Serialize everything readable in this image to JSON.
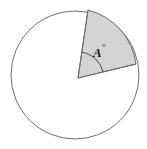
{
  "figure": {
    "name": "circle-with-shaded-sector",
    "caption": "",
    "background_color": "#ffffff"
  },
  "circle": {
    "center_x": 75,
    "center_y": 75,
    "radius": 64,
    "stroke_color": "#6e6e6e",
    "stroke_width": 1,
    "fill_color": "#ffffff"
  },
  "sector": {
    "label": "A",
    "degree_symbol": "°",
    "label_full": "A°",
    "vertex_x": 78,
    "vertex_y": 78,
    "start_angle_deg": 82,
    "end_angle_deg": 16,
    "radius_a_end_x": 88,
    "radius_a_end_y": 10,
    "radius_b_end_x": 136,
    "radius_b_end_y": 64,
    "fill_color": "#d4d4d4",
    "stroke_color": "#6e6e6e",
    "stroke_width": 1
  },
  "angle_arc": {
    "radius": 26,
    "stroke_color": "#4a4a4a",
    "stroke_width": 1,
    "fill": "none"
  },
  "label_position": {
    "x": 93,
    "y": 57,
    "degree_x": 103,
    "degree_y": 51
  }
}
